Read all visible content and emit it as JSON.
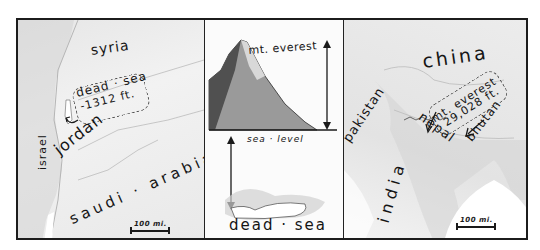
{
  "figure": {
    "type": "hand-drawn illustrated map comparison",
    "panels": [
      {
        "id": "middle-east",
        "labels": {
          "country_1": "syria",
          "country_2": "israel",
          "country_3": "jordan",
          "country_4": "saudi · arabia",
          "feature": "dead · sea",
          "feature_elevation": "-1312 ft."
        },
        "scale_label": "100 mi."
      },
      {
        "id": "elevation-comparison",
        "labels": {
          "top": "mt. everest",
          "reference": "sea · level",
          "bottom": "dead · sea"
        }
      },
      {
        "id": "south-asia",
        "labels": {
          "country_1": "china",
          "country_2": "pakistan",
          "country_3": "nepal",
          "country_4": "bhutan",
          "country_5": "india",
          "feature": "mt. everest",
          "feature_elevation": "29,028 ft."
        },
        "scale_label": "100 mi."
      }
    ]
  }
}
